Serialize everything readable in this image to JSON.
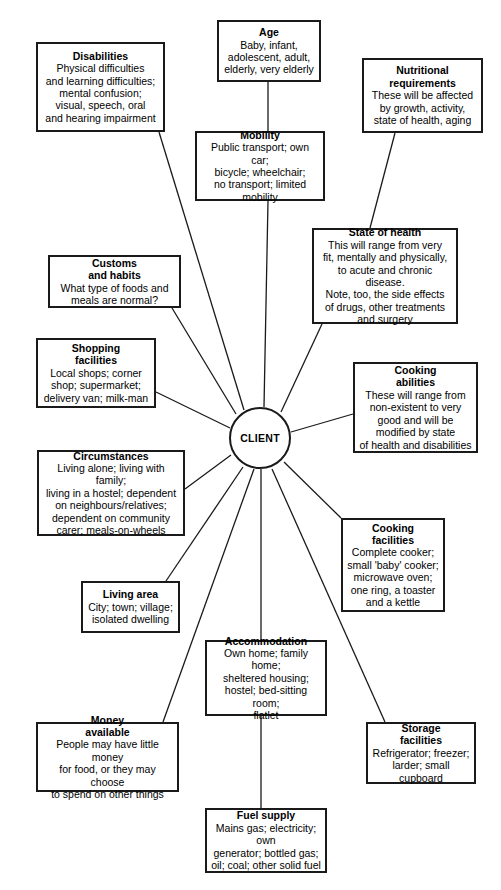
{
  "diagram": {
    "type": "radial-spider-diagram",
    "hub": {
      "label": "CLIENT",
      "shape": "circle",
      "cx": 260,
      "cy": 438,
      "r": 31
    },
    "stroke_color": "#1a1a1a",
    "background_color": "#ffffff",
    "text_color": "#000000",
    "nodes": [
      {
        "id": "age",
        "title": "Age",
        "body": "Baby, infant,\nadolescent, adult,\nelderly, very elderly",
        "x": 217,
        "y": 20,
        "w": 104,
        "h": 62,
        "anchor_x": 268,
        "anchor_y": 82
      },
      {
        "id": "disabilities",
        "title": "Disabilities",
        "body": "Physical difficulties\nand learning difficulties;\nmental confusion;\nvisual, speech, oral\nand hearing impairment",
        "x": 36,
        "y": 42,
        "w": 129,
        "h": 90,
        "anchor_x": 159,
        "anchor_y": 132
      },
      {
        "id": "nutritional-requirements",
        "title": "Nutritional\nrequirements",
        "body": "These will be affected\nby growth, activity,\nstate of health, aging",
        "x": 362,
        "y": 58,
        "w": 121,
        "h": 75,
        "anchor_x": 395,
        "anchor_y": 133
      },
      {
        "id": "mobility",
        "title": "Mobility",
        "body": "Public transport; own car;\nbicycle; wheelchair;\nno transport; limited\nmobility",
        "x": 195,
        "y": 131,
        "w": 130,
        "h": 70,
        "anchor_x": 268,
        "anchor_y": 201
      },
      {
        "id": "state-of-health",
        "title": "State of health",
        "body": "This will range from very\nfit, mentally and physically,\nto acute and chronic disease.\nNote, too, the side effects\nof drugs, other treatments\nand surgery",
        "x": 312,
        "y": 228,
        "w": 146,
        "h": 96,
        "anchor_x": 322,
        "anchor_y": 324
      },
      {
        "id": "customs-and-habits",
        "title": "Customs\nand habits",
        "body": "What type of foods and\nmeals are normal?",
        "x": 48,
        "y": 255,
        "w": 133,
        "h": 53,
        "anchor_x": 172,
        "anchor_y": 308
      },
      {
        "id": "shopping-facilities",
        "title": "Shopping\nfacilities",
        "body": "Local shops; corner\nshop; supermarket;\ndelivery van; milk-man",
        "x": 36,
        "y": 338,
        "w": 120,
        "h": 70,
        "anchor_x": 156,
        "anchor_y": 392
      },
      {
        "id": "cooking-abilities",
        "title": "Cooking\nabilities",
        "body": "These will range from\nnon-existent to very\ngood and will be\nmodified by state\nof health and disabilities",
        "x": 353,
        "y": 362,
        "w": 125,
        "h": 91,
        "anchor_x": 353,
        "anchor_y": 414
      },
      {
        "id": "circumstances",
        "title": "Circumstances",
        "body": "Living alone; living with family;\nliving in a hostel; dependent\non neighbours/relatives;\ndependent on community\ncarer; meals-on-wheels",
        "x": 37,
        "y": 450,
        "w": 148,
        "h": 86,
        "anchor_x": 185,
        "anchor_y": 489
      },
      {
        "id": "cooking-facilities",
        "title": "Cooking\nfacilities",
        "body": "Complete cooker;\nsmall 'baby' cooker;\nmicrowave oven;\none ring, a toaster\nand a kettle",
        "x": 341,
        "y": 518,
        "w": 104,
        "h": 94,
        "anchor_x": 341,
        "anchor_y": 518
      },
      {
        "id": "living-area",
        "title": "Living area",
        "body": "City; town; village;\nisolated dwelling",
        "x": 81,
        "y": 581,
        "w": 99,
        "h": 52,
        "anchor_x": 166,
        "anchor_y": 581
      },
      {
        "id": "accommodation",
        "title": "Accommodation",
        "body": "Own home; family home;\nsheltered housing;\nhostel; bed-sitting room;\nflatlet",
        "x": 205,
        "y": 640,
        "w": 122,
        "h": 76,
        "anchor_x": 261,
        "anchor_y": 640
      },
      {
        "id": "money-available",
        "title": "Money\navailable",
        "body": "People may have little money\nfor food, or they may choose\nto spend on other things",
        "x": 36,
        "y": 722,
        "w": 143,
        "h": 70,
        "anchor_x": 163,
        "anchor_y": 722
      },
      {
        "id": "storage-facilities",
        "title": "Storage\nfacilities",
        "body": "Refrigerator; freezer;\nlarder; small cupboard",
        "x": 366,
        "y": 722,
        "w": 110,
        "h": 62,
        "anchor_x": 385,
        "anchor_y": 722
      },
      {
        "id": "fuel-supply",
        "title": "Fuel supply",
        "body": "Mains gas; electricity; own\ngenerator; bottled gas;\noil; coal; other solid fuel",
        "x": 205,
        "y": 808,
        "w": 122,
        "h": 65,
        "anchor_x": 261,
        "anchor_y": 808
      }
    ],
    "connectors": [
      {
        "from": "age",
        "to": "mobility",
        "x1": 268,
        "y1": 82,
        "x2": 268,
        "y2": 131
      },
      {
        "from": "mobility",
        "to": "hub",
        "x1": 268,
        "y1": 201,
        "x2": 264,
        "y2": 407
      },
      {
        "from": "disabilities",
        "to": "hub",
        "x1": 159,
        "y1": 132,
        "x2": 244,
        "y2": 410
      },
      {
        "from": "nutritional-requirements",
        "to": "state-of-health",
        "x1": 395,
        "y1": 133,
        "x2": 370,
        "y2": 228
      },
      {
        "from": "state-of-health",
        "to": "hub",
        "x1": 322,
        "y1": 324,
        "x2": 281,
        "y2": 412
      },
      {
        "from": "customs-and-habits",
        "to": "hub",
        "x1": 172,
        "y1": 308,
        "x2": 236,
        "y2": 414
      },
      {
        "from": "shopping-facilities",
        "to": "hub",
        "x1": 156,
        "y1": 392,
        "x2": 230,
        "y2": 428
      },
      {
        "from": "cooking-abilities",
        "to": "hub",
        "x1": 353,
        "y1": 414,
        "x2": 291,
        "y2": 432
      },
      {
        "from": "circumstances",
        "to": "hub",
        "x1": 185,
        "y1": 489,
        "x2": 231,
        "y2": 455
      },
      {
        "from": "living-area",
        "to": "hub",
        "x1": 166,
        "y1": 581,
        "x2": 243,
        "y2": 467
      },
      {
        "from": "money-available",
        "to": "hub",
        "x1": 163,
        "y1": 722,
        "x2": 254,
        "y2": 469
      },
      {
        "from": "accommodation",
        "to": "hub",
        "x1": 261,
        "y1": 640,
        "x2": 261,
        "y2": 469
      },
      {
        "from": "accommodation",
        "to": "fuel-supply",
        "x1": 261,
        "y1": 716,
        "x2": 261,
        "y2": 808
      },
      {
        "from": "cooking-facilities",
        "to": "hub",
        "x1": 341,
        "y1": 518,
        "x2": 284,
        "y2": 462
      },
      {
        "from": "storage-facilities",
        "to": "hub",
        "x1": 385,
        "y1": 722,
        "x2": 272,
        "y2": 469
      }
    ]
  }
}
